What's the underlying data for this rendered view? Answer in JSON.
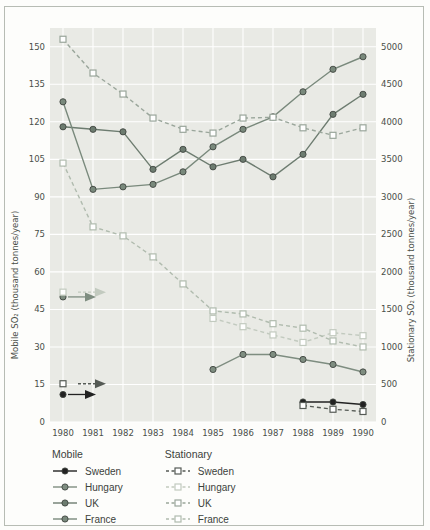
{
  "chart_data": {
    "type": "line",
    "x": [
      1980,
      1981,
      1982,
      1983,
      1984,
      1985,
      1986,
      1987,
      1988,
      1989,
      1990
    ],
    "left_axis": {
      "label": "Mobile SO₂ (thousand tonnes/year)",
      "ticks": [
        0,
        15,
        30,
        45,
        60,
        75,
        90,
        105,
        120,
        135,
        150
      ],
      "range": [
        0,
        157.5
      ]
    },
    "right_axis": {
      "label": "Stationary SO₂ (thousand tonnes/year)",
      "ticks": [
        0,
        500,
        1000,
        1500,
        2000,
        2500,
        3000,
        3500,
        4000,
        4500,
        5000
      ],
      "range": [
        0,
        5250
      ]
    },
    "x_axis": {
      "tick_labels": [
        "1980",
        "1981",
        "1982",
        "1983",
        "1984",
        "1985",
        "1986",
        "1987",
        "1988",
        "1989",
        "1990"
      ]
    },
    "legend": {
      "mobile_header": "Mobile",
      "stationary_header": "Stationary",
      "mobile_items": [
        "Sweden",
        "Hungary",
        "UK",
        "France"
      ],
      "stationary_items": [
        "Sweden",
        "Hungary",
        "UK",
        "France"
      ]
    },
    "series": [
      {
        "name": "Sweden",
        "group": "Mobile",
        "axis": "left",
        "line": "solid",
        "marker": "circle",
        "color": "#222222",
        "values": [
          11,
          null,
          null,
          null,
          null,
          null,
          null,
          null,
          8,
          8,
          7
        ],
        "arrow_at_1980": true
      },
      {
        "name": "Hungary",
        "group": "Mobile",
        "axis": "left",
        "line": "solid",
        "marker": "circle",
        "color": "#7e8d80",
        "values": [
          50,
          null,
          null,
          null,
          null,
          21,
          27,
          27,
          25,
          23,
          20
        ],
        "arrow_at_1980": true
      },
      {
        "name": "UK",
        "group": "Mobile",
        "axis": "left",
        "line": "solid",
        "marker": "circle",
        "color": "#6d7c70",
        "values": [
          118,
          117,
          116,
          101,
          109,
          102,
          105,
          98,
          107,
          123,
          131
        ],
        "arrow_at_1980": false
      },
      {
        "name": "France",
        "group": "Mobile",
        "axis": "left",
        "line": "solid",
        "marker": "circle",
        "color": "#79897c",
        "values": [
          128,
          93,
          94,
          95,
          100,
          110,
          117,
          122,
          132,
          141,
          146
        ],
        "arrow_at_1980": false
      },
      {
        "name": "Sweden",
        "group": "Stationary",
        "axis": "right",
        "line": "dashed",
        "marker": "square",
        "color": "#555a55",
        "values": [
          510,
          null,
          null,
          null,
          null,
          null,
          null,
          null,
          220,
          170,
          140
        ],
        "arrow_at_1980": true
      },
      {
        "name": "Hungary",
        "group": "Stationary",
        "axis": "right",
        "line": "dashed",
        "marker": "square",
        "color": "#c2cabf",
        "values": [
          1730,
          null,
          null,
          null,
          null,
          1380,
          1270,
          1160,
          1060,
          1190,
          1150
        ],
        "arrow_at_1980": true
      },
      {
        "name": "UK",
        "group": "Stationary",
        "axis": "right",
        "line": "dashed",
        "marker": "square",
        "color": "#9aa69b",
        "values": [
          5100,
          4650,
          4370,
          4050,
          3900,
          3850,
          4050,
          4060,
          3920,
          3820,
          3920
        ],
        "arrow_at_1980": false
      },
      {
        "name": "France",
        "group": "Stationary",
        "axis": "right",
        "line": "dashed",
        "marker": "square",
        "color": "#b0bbae",
        "values": [
          3450,
          2600,
          2480,
          2200,
          1840,
          1480,
          1440,
          1310,
          1250,
          1080,
          1000
        ],
        "arrow_at_1980": false
      }
    ],
    "style": {
      "panel_bg": "#e9eae5",
      "grid_color": "#ffffff",
      "tick_text_color": "#4a4f49",
      "marker_outline": "#3f4540"
    }
  }
}
